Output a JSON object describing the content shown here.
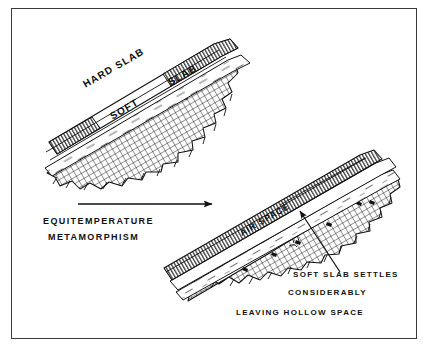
{
  "figure": {
    "background_color": "#ffffff",
    "ink_color": "#111111",
    "frame_color": "#3a3a3a"
  },
  "upper_diagram": {
    "name": "before-metamorphism",
    "labels": {
      "hard_slab": "HARD  SLAB",
      "soft_slab_word": "SOFT",
      "slab_word": "SLAB"
    },
    "layers": [
      {
        "name": "hard-slab-layer",
        "pattern": "vertical-hatch"
      },
      {
        "name": "soft-slab-layer",
        "pattern": "dashed-flecks"
      },
      {
        "name": "ground-layer",
        "pattern": "cross-hatch"
      }
    ]
  },
  "process_arrow": {
    "name": "equitemperature-arrow",
    "caption_line1": "EQUITEMPERATURE",
    "caption_line2": "METAMORPHISM",
    "direction": "right"
  },
  "lower_diagram": {
    "name": "after-metamorphism",
    "labels": {
      "air_space": "AIR  SPACE"
    },
    "layers": [
      {
        "name": "hard-slab-layer",
        "pattern": "vertical-hatch"
      },
      {
        "name": "air-space-layer",
        "pattern": "void"
      },
      {
        "name": "soft-slab-layer",
        "pattern": "dashed-flecks"
      },
      {
        "name": "ground-layer",
        "pattern": "cross-hatch"
      }
    ],
    "callout": {
      "name": "air-space-callout-arrow",
      "line1": "SOFT    SLAB    SETTLES",
      "line2": "CONSIDERABLY",
      "line3": "LEAVING    HOLLOW    SPACE"
    }
  }
}
